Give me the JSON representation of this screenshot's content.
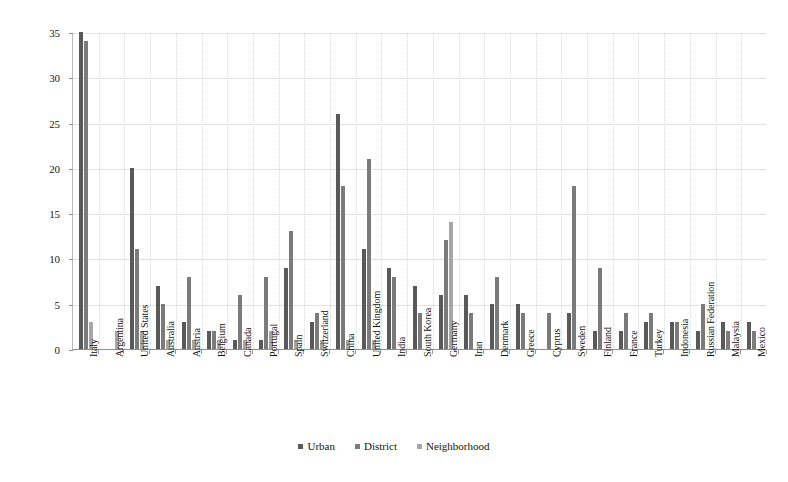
{
  "chart_data": {
    "type": "bar",
    "title": "",
    "subtitle": "",
    "xlabel": "",
    "ylabel": "",
    "ylim": [
      0,
      35
    ],
    "yticks": [
      0,
      5,
      10,
      15,
      20,
      25,
      30,
      35
    ],
    "grid": true,
    "legend_position": "bottom",
    "categories": [
      "Italy",
      "Argentina",
      "United States",
      "Australia",
      "Austria",
      "Belgium",
      "Canada",
      "Portugal",
      "Spain",
      "Switzerland",
      "China",
      "United Kingdom",
      "India",
      "South Korea",
      "Germany",
      "Iran",
      "Denmark",
      "Greece",
      "Cyprus",
      "Sweden",
      "Finland",
      "France",
      "Turkey",
      "Indonesia",
      "Russian Federation",
      "Malaysia",
      "Mexico"
    ],
    "series": [
      {
        "name": "Urban",
        "color": "#595959",
        "values": [
          35,
          0,
          20,
          7,
          3,
          2,
          1,
          1,
          9,
          3,
          26,
          11,
          9,
          7,
          6,
          6,
          5,
          5,
          0,
          4,
          2,
          2,
          3,
          3,
          2,
          3,
          3
        ]
      },
      {
        "name": "District",
        "color": "#7b7b7b",
        "values": [
          34,
          0,
          11,
          5,
          8,
          2,
          6,
          8,
          13,
          4,
          18,
          21,
          8,
          4,
          12,
          4,
          8,
          4,
          4,
          18,
          9,
          4,
          4,
          3,
          5,
          2,
          2
        ]
      },
      {
        "name": "Neighborhood",
        "color": "#a6a6a6",
        "values": [
          3,
          2,
          2,
          1,
          1,
          1,
          1,
          2,
          1,
          1,
          1,
          1,
          0,
          0,
          14,
          0,
          0,
          0,
          0,
          0,
          0,
          0,
          0,
          0,
          0,
          0,
          0
        ]
      }
    ]
  },
  "legend": {
    "items": [
      {
        "label": "Urban",
        "color": "#595959"
      },
      {
        "label": "District",
        "color": "#7b7b7b"
      },
      {
        "label": "Neighborhood",
        "color": "#a6a6a6"
      }
    ]
  }
}
